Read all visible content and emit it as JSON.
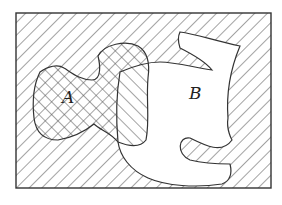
{
  "diagram": {
    "type": "venn-diagram",
    "universe": {
      "shape": "rectangle",
      "hatch": "diagonal-backslash"
    },
    "sets": [
      {
        "id": "A",
        "label": "A",
        "hatch": "diagonal-slash",
        "appearance": "cross-hatched where outside B"
      },
      {
        "id": "B",
        "label": "B",
        "appearance": "white (unshaded) except where overlapping A"
      }
    ],
    "colors": {
      "stroke": "#333333",
      "hatch": "#555555",
      "background": "#ffffff"
    }
  }
}
